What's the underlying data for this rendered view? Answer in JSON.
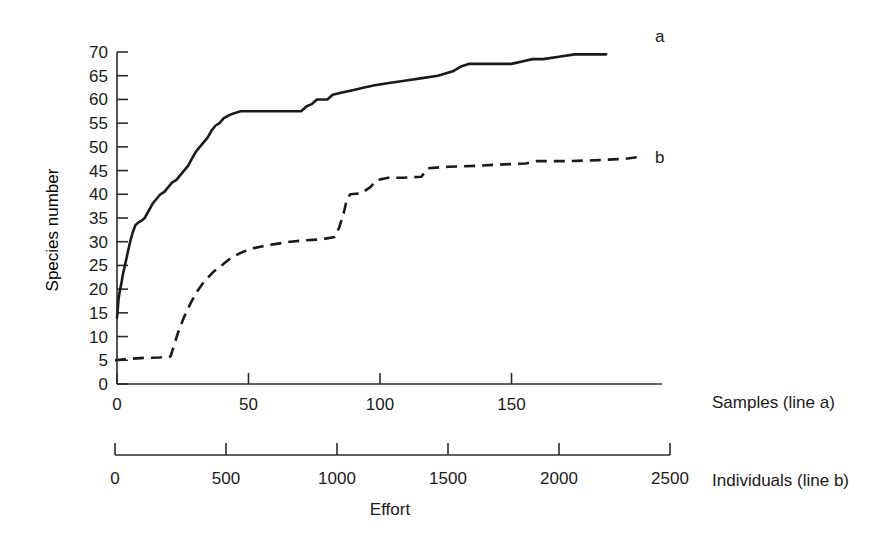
{
  "chart_data": {
    "type": "line",
    "title": "",
    "subtitle": "",
    "ylabel": "Species number",
    "xlabel": "Effort",
    "xlabel_top": "Samples (line a)",
    "xlabel_bottom": "Individuals (line b)",
    "grid": false,
    "legend_position": "right-inline",
    "ylim": [
      0,
      70
    ],
    "yticks": [
      0,
      5,
      10,
      15,
      20,
      25,
      30,
      35,
      40,
      45,
      50,
      55,
      60,
      65,
      70
    ],
    "ytick_labels": [
      "0",
      "5",
      "10",
      "15",
      "20",
      "25",
      "30",
      "35",
      "40",
      "45",
      "50",
      "55",
      "60",
      "65",
      "70"
    ],
    "xlim_top": [
      0,
      200
    ],
    "xticks_top": [
      0,
      50,
      100,
      150
    ],
    "xtick_labels_top": [
      "0",
      "50",
      "100",
      "150"
    ],
    "xlim_bottom": [
      0,
      2500
    ],
    "xticks_bottom": [
      0,
      500,
      1000,
      1500,
      2000,
      2500
    ],
    "xtick_labels_bottom": [
      "0",
      "500",
      "1000",
      "1500",
      "2000",
      "2500"
    ],
    "series": [
      {
        "name": "a",
        "label": "a",
        "style": "solid",
        "color": "#1a1a1a",
        "x_axis": "top",
        "x_units": "samples",
        "points": [
          [
            0,
            14
          ],
          [
            0.6,
            18
          ],
          [
            1.2,
            20
          ],
          [
            1.6,
            21
          ],
          [
            2.2,
            23
          ],
          [
            3,
            25
          ],
          [
            4,
            27.5
          ],
          [
            5,
            30
          ],
          [
            6,
            32
          ],
          [
            7,
            33.5
          ],
          [
            8,
            34
          ],
          [
            9.5,
            34.5
          ],
          [
            10.5,
            35
          ],
          [
            11.5,
            36
          ],
          [
            12.5,
            37
          ],
          [
            13.5,
            38
          ],
          [
            15,
            39
          ],
          [
            16.5,
            40
          ],
          [
            18,
            40.5
          ],
          [
            19.5,
            41.5
          ],
          [
            21,
            42.5
          ],
          [
            22.5,
            43
          ],
          [
            24,
            44
          ],
          [
            25.5,
            45
          ],
          [
            27,
            46
          ],
          [
            28.5,
            47.5
          ],
          [
            30,
            49
          ],
          [
            31.5,
            50
          ],
          [
            33,
            51
          ],
          [
            34.5,
            52
          ],
          [
            36,
            53.5
          ],
          [
            37.5,
            54.5
          ],
          [
            39,
            55
          ],
          [
            40.5,
            56
          ],
          [
            42,
            56.5
          ],
          [
            44,
            57
          ],
          [
            47,
            57.5
          ],
          [
            70,
            57.5
          ],
          [
            72,
            58.5
          ],
          [
            74,
            59
          ],
          [
            76,
            60
          ],
          [
            80,
            60
          ],
          [
            82,
            61
          ],
          [
            86,
            61.5
          ],
          [
            90,
            62
          ],
          [
            94,
            62.5
          ],
          [
            98,
            63
          ],
          [
            104,
            63.5
          ],
          [
            110,
            64
          ],
          [
            116,
            64.5
          ],
          [
            122,
            65
          ],
          [
            128,
            66
          ],
          [
            131,
            67
          ],
          [
            134,
            67.5
          ],
          [
            150,
            67.5
          ],
          [
            154,
            68
          ],
          [
            158,
            68.5
          ],
          [
            162,
            68.5
          ],
          [
            168,
            69
          ],
          [
            174,
            69.5
          ],
          [
            186,
            69.5
          ]
        ]
      },
      {
        "name": "b",
        "label": "b",
        "style": "dashed",
        "color": "#1a1a1a",
        "x_axis": "bottom",
        "x_units": "individuals",
        "points": [
          [
            0,
            5
          ],
          [
            60,
            5.3
          ],
          [
            130,
            5.5
          ],
          [
            200,
            5.6
          ],
          [
            250,
            5.8
          ],
          [
            265,
            8
          ],
          [
            285,
            11
          ],
          [
            310,
            14
          ],
          [
            340,
            17
          ],
          [
            370,
            19.5
          ],
          [
            400,
            21.5
          ],
          [
            440,
            23.5
          ],
          [
            480,
            25
          ],
          [
            520,
            26.5
          ],
          [
            560,
            27.5
          ],
          [
            610,
            28.5
          ],
          [
            660,
            29
          ],
          [
            720,
            29.5
          ],
          [
            790,
            30
          ],
          [
            860,
            30.3
          ],
          [
            930,
            30.5
          ],
          [
            990,
            31
          ],
          [
            1010,
            33
          ],
          [
            1030,
            36
          ],
          [
            1045,
            39
          ],
          [
            1060,
            40
          ],
          [
            1110,
            40.2
          ],
          [
            1150,
            41.5
          ],
          [
            1180,
            43
          ],
          [
            1230,
            43.5
          ],
          [
            1300,
            43.5
          ],
          [
            1380,
            43.7
          ],
          [
            1410,
            45.5
          ],
          [
            1500,
            45.8
          ],
          [
            1620,
            46
          ],
          [
            1750,
            46.3
          ],
          [
            1850,
            46.5
          ],
          [
            1900,
            47
          ],
          [
            2050,
            47
          ],
          [
            2180,
            47.2
          ],
          [
            2300,
            47.5
          ],
          [
            2380,
            48
          ]
        ]
      }
    ],
    "annotations": [
      {
        "text": "a",
        "refers_to": "series a end label"
      },
      {
        "text": "b",
        "refers_to": "series b end label"
      }
    ]
  },
  "axes": {
    "y_title": "Species number",
    "x_title": "Effort",
    "top_axis_title": "Samples (line a)",
    "bottom_axis_title": "Individuals (line b)"
  },
  "colors": {
    "background": "#ffffff",
    "ink": "#1a1a1a",
    "axis": "#2b2b2b"
  }
}
